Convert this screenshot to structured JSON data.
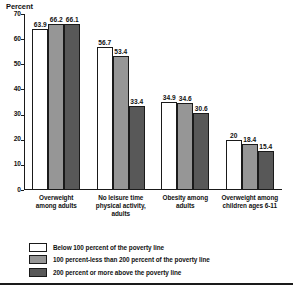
{
  "chart_data": {
    "type": "bar",
    "title": "",
    "ylabel": "Percent",
    "xlabel": "",
    "ylim": [
      0,
      70
    ],
    "yticks": [
      0,
      10,
      20,
      30,
      40,
      50,
      60,
      70
    ],
    "grid": false,
    "legend_position": "bottom-left",
    "categories": [
      "Overweight among adults",
      "No leisure time physical activity, adults",
      "Obesity among adults",
      "Overweight among children ages 6-11"
    ],
    "category_lines": [
      [
        "Overweight",
        "among adults"
      ],
      [
        "No leisure time",
        "physical activity,",
        "adults"
      ],
      [
        "Obesity among",
        "adults"
      ],
      [
        "Overweight among",
        "children ages 6-11"
      ]
    ],
    "series": [
      {
        "name": "Below 100 percent of the poverty line",
        "color": "#ffffff",
        "values": [
          63.9,
          56.7,
          34.9,
          20
        ],
        "labels": [
          "63.9",
          "56.7",
          "34.9",
          "20"
        ]
      },
      {
        "name": "100 percent-less than 200 percent of the poverty line",
        "color": "#969696",
        "values": [
          66.2,
          53.4,
          34.6,
          18.4
        ],
        "labels": [
          "66.2",
          "53.4",
          "34.6",
          "18.4"
        ]
      },
      {
        "name": "200 percent or more above the poverty line",
        "color": "#585858",
        "values": [
          66.1,
          33.4,
          30.6,
          15.4
        ],
        "labels": [
          "66.1",
          "33.4",
          "30.6",
          "15.4"
        ]
      }
    ]
  },
  "axis": {
    "y_title": "Percent",
    "tick_labels": [
      "70",
      "60",
      "50",
      "40",
      "30",
      "20",
      "10",
      "0"
    ]
  },
  "legend": {
    "items": [
      {
        "swatch": "c0",
        "label": "Below 100 percent of the poverty line"
      },
      {
        "swatch": "c1",
        "label": "100 percent-less than 200 percent of the poverty line"
      },
      {
        "swatch": "c2",
        "label": "200 percent or more above the poverty line"
      }
    ]
  }
}
